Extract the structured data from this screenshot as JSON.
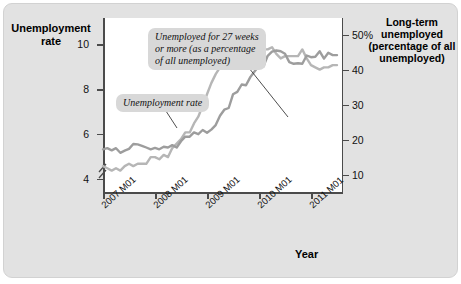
{
  "figure": {
    "background_color": "#e2e2e2",
    "plot_background": "#ffffff"
  },
  "axes": {
    "left_title": "Unemployment\nrate",
    "right_title": "Long-term\nunemployed\n(percentage\nof all\nunemployed)",
    "x_title": "Year",
    "left_ticks": [
      "10",
      "8",
      "6",
      "4"
    ],
    "right_ticks": [
      "50%",
      "40",
      "30",
      "20",
      "10"
    ],
    "x_ticks": [
      "2007 M01",
      "2008 M01",
      "2009 M01",
      "2010 M01",
      "2011 M01"
    ],
    "axis_break": true
  },
  "annotations": [
    {
      "name": "long-term-callout",
      "text": "Unemployed for 27 weeks\nor more (as a percentage\nof all unemployed)"
    },
    {
      "name": "unemployment-rate-callout",
      "text": "Unemployment rate"
    }
  ],
  "chart_data": {
    "type": "line",
    "title": "",
    "xlabel": "Year",
    "ylabel": "Unemployment rate",
    "y2label": "Long-term unemployed (percentage of all unemployed)",
    "grid": false,
    "legend": "annotated-callouts",
    "ylim": [
      3.4,
      11.2
    ],
    "y2lim": [
      5,
      55
    ],
    "xlim": [
      "2007 M01",
      "2011 M08"
    ],
    "x_tick_labels": [
      "2007 M01",
      "2008 M01",
      "2009 M01",
      "2010 M01",
      "2011 M01"
    ],
    "y_ticks": [
      4,
      6,
      8,
      10
    ],
    "y2_ticks": [
      10,
      20,
      30,
      40,
      50
    ],
    "series": [
      {
        "name": "Unemployment rate",
        "axis": "left",
        "color": "#b5b5b5",
        "unit": "percent",
        "x": [
          "2007 M01",
          "2007 M02",
          "2007 M03",
          "2007 M04",
          "2007 M05",
          "2007 M06",
          "2007 M07",
          "2007 M08",
          "2007 M09",
          "2007 M10",
          "2007 M11",
          "2007 M12",
          "2008 M01",
          "2008 M02",
          "2008 M03",
          "2008 M04",
          "2008 M05",
          "2008 M06",
          "2008 M07",
          "2008 M08",
          "2008 M09",
          "2008 M10",
          "2008 M11",
          "2008 M12",
          "2009 M01",
          "2009 M02",
          "2009 M03",
          "2009 M04",
          "2009 M05",
          "2009 M06",
          "2009 M07",
          "2009 M08",
          "2009 M09",
          "2009 M10",
          "2009 M11",
          "2009 M12",
          "2010 M01",
          "2010 M02",
          "2010 M03",
          "2010 M04",
          "2010 M05",
          "2010 M06",
          "2010 M07",
          "2010 M08",
          "2010 M09",
          "2010 M10",
          "2010 M11",
          "2010 M12",
          "2011 M01",
          "2011 M02",
          "2011 M03",
          "2011 M04",
          "2011 M05",
          "2011 M06",
          "2011 M07"
        ],
        "values": [
          4.6,
          4.5,
          4.4,
          4.5,
          4.4,
          4.6,
          4.7,
          4.6,
          4.7,
          4.7,
          4.7,
          5.0,
          5.0,
          4.9,
          5.1,
          5.0,
          5.4,
          5.6,
          5.8,
          6.1,
          6.1,
          6.5,
          6.8,
          7.3,
          7.8,
          8.3,
          8.7,
          9.0,
          9.4,
          9.5,
          9.5,
          9.6,
          9.8,
          10.0,
          9.9,
          9.9,
          9.8,
          9.8,
          9.8,
          9.9,
          9.6,
          9.4,
          9.5,
          9.5,
          9.5,
          9.5,
          9.8,
          9.4,
          9.1,
          9.0,
          8.9,
          9.0,
          9.0,
          9.1,
          9.1
        ]
      },
      {
        "name": "Unemployed for 27 weeks or more (as a percentage of all unemployed)",
        "axis": "right",
        "color": "#9a9a9a",
        "unit": "percent",
        "x": [
          "2007 M01",
          "2007 M02",
          "2007 M03",
          "2007 M04",
          "2007 M05",
          "2007 M06",
          "2007 M07",
          "2007 M08",
          "2007 M09",
          "2007 M10",
          "2007 M11",
          "2007 M12",
          "2008 M01",
          "2008 M02",
          "2008 M03",
          "2008 M04",
          "2008 M05",
          "2008 M06",
          "2008 M07",
          "2008 M08",
          "2008 M09",
          "2008 M10",
          "2008 M11",
          "2008 M12",
          "2009 M01",
          "2009 M02",
          "2009 M03",
          "2009 M04",
          "2009 M05",
          "2009 M06",
          "2009 M07",
          "2009 M08",
          "2009 M09",
          "2009 M10",
          "2009 M11",
          "2009 M12",
          "2010 M01",
          "2010 M02",
          "2010 M03",
          "2010 M04",
          "2010 M05",
          "2010 M06",
          "2010 M07",
          "2010 M08",
          "2010 M09",
          "2010 M10",
          "2010 M11",
          "2010 M12",
          "2011 M01",
          "2011 M02",
          "2011 M03",
          "2011 M04",
          "2011 M05",
          "2011 M06",
          "2011 M07"
        ],
        "values": [
          17.5,
          17.8,
          17.2,
          17.8,
          16.5,
          17.1,
          17.6,
          19.0,
          18.9,
          18.5,
          18.0,
          17.5,
          17.9,
          17.5,
          18.2,
          18.0,
          18.7,
          18.0,
          19.8,
          21.1,
          21.1,
          22.3,
          21.8,
          23.0,
          22.2,
          23.1,
          24.4,
          27.1,
          28.8,
          29.3,
          33.2,
          33.9,
          36.0,
          35.8,
          38.1,
          39.8,
          41.3,
          41.1,
          44.2,
          45.4,
          45.7,
          45.5,
          44.8,
          42.4,
          41.9,
          42.1,
          41.9,
          44.3,
          43.8,
          43.9,
          45.5,
          43.4,
          45.1,
          44.4,
          44.4
        ]
      }
    ]
  }
}
